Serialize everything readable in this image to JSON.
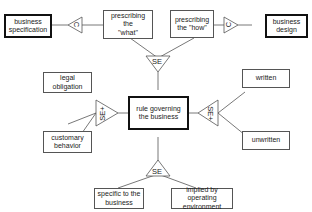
{
  "diagram": {
    "nodes": {
      "business_specification": "business\nspecification",
      "prescribing_what": "prescribing the\n\"what\"",
      "prescribing_how": "prescribing\nthe \"how\"",
      "business_design": "business\ndesign",
      "legal_obligation": "legal\nobligation",
      "customary_behavior": "customary\nbehavior",
      "rule_governing": "rule governing\nthe business",
      "written": "written",
      "unwritten": "unwritten",
      "specific_to_business": "specific to the\nbusiness",
      "implied_by_environment": "implied by operating\nenvironment"
    },
    "connectors": {
      "left_c": "C",
      "right_c": "C",
      "top_se": "SE",
      "left_se_plus": "SE+",
      "right_se_plus": "SE+",
      "bottom_se": "SE"
    },
    "colors": {
      "line": "#555555",
      "bold_border": "#111111",
      "text": "#222222"
    }
  }
}
